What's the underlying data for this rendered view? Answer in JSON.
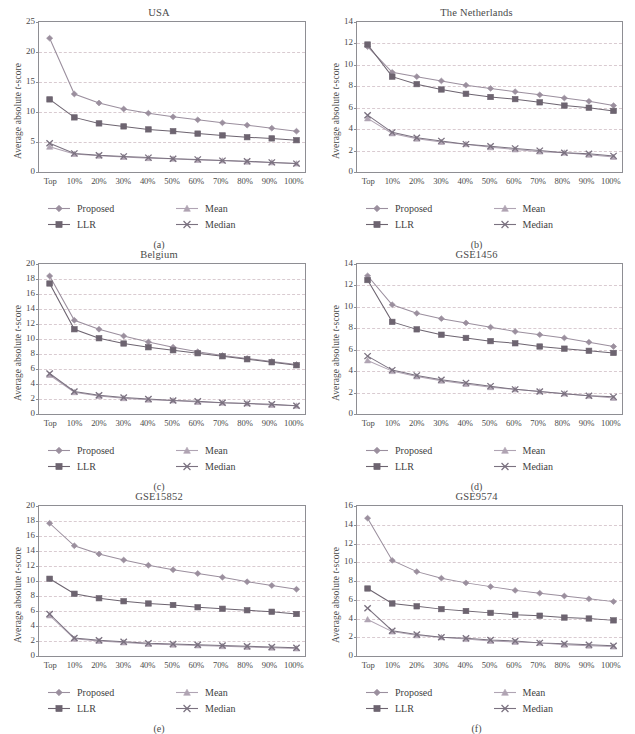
{
  "figure": {
    "ylabel": "Average absolute t-score",
    "xcategories": [
      "Top",
      "10%",
      "20%",
      "30%",
      "40%",
      "50%",
      "60%",
      "70%",
      "80%",
      "90%",
      "100%"
    ],
    "legend": [
      {
        "name": "Proposed",
        "marker": "diamond",
        "color": "#9b8f9e"
      },
      {
        "name": "LLR",
        "marker": "square",
        "color": "#6d6470"
      },
      {
        "name": "Mean",
        "marker": "triangle",
        "color": "#b0a4b3"
      },
      {
        "name": "Median",
        "marker": "cross",
        "color": "#7b7280"
      }
    ],
    "colors": {
      "axis": "#8e8e93",
      "grid": "#d8c9cf",
      "text": "#4a4a4a",
      "proposed": "#9b8f9e",
      "llr": "#6d6470",
      "mean": "#b0a4b3",
      "median": "#7b7280"
    }
  },
  "chart_data": [
    {
      "type": "line",
      "panel": "a",
      "caption": "(a)",
      "title": "USA",
      "xlabel": "",
      "ylabel": "Average absolute t-score",
      "x": [
        "Top",
        "10%",
        "20%",
        "30%",
        "40%",
        "50%",
        "60%",
        "70%",
        "80%",
        "90%",
        "100%"
      ],
      "ylim": [
        0,
        25
      ],
      "yticks": [
        0,
        5,
        10,
        15,
        20,
        25
      ],
      "grid": true,
      "legend_position": "below",
      "series": [
        {
          "name": "Proposed",
          "values": [
            22.3,
            13.0,
            11.5,
            10.5,
            9.8,
            9.2,
            8.7,
            8.2,
            7.8,
            7.3,
            6.8
          ]
        },
        {
          "name": "LLR",
          "values": [
            12.1,
            9.1,
            8.1,
            7.6,
            7.1,
            6.8,
            6.4,
            6.1,
            5.8,
            5.6,
            5.3
          ]
        },
        {
          "name": "Mean",
          "values": [
            4.2,
            3.0,
            2.7,
            2.5,
            2.3,
            2.2,
            2.0,
            1.9,
            1.7,
            1.6,
            1.4
          ]
        },
        {
          "name": "Median",
          "values": [
            4.8,
            3.1,
            2.8,
            2.6,
            2.4,
            2.2,
            2.1,
            1.9,
            1.8,
            1.6,
            1.4
          ]
        }
      ]
    },
    {
      "type": "line",
      "panel": "b",
      "caption": "(b)",
      "title": "The Netherlands",
      "xlabel": "",
      "ylabel": "Average absolute t-score",
      "x": [
        "Top",
        "10%",
        "20%",
        "30%",
        "40%",
        "50%",
        "60%",
        "70%",
        "80%",
        "90%",
        "100%"
      ],
      "ylim": [
        0,
        14
      ],
      "yticks": [
        0,
        2,
        4,
        6,
        8,
        10,
        12,
        14
      ],
      "grid": true,
      "legend_position": "below",
      "series": [
        {
          "name": "Proposed",
          "values": [
            11.7,
            9.3,
            8.9,
            8.5,
            8.1,
            7.8,
            7.5,
            7.2,
            6.9,
            6.6,
            6.2
          ]
        },
        {
          "name": "LLR",
          "values": [
            11.9,
            8.9,
            8.2,
            7.7,
            7.3,
            7.0,
            6.8,
            6.5,
            6.2,
            6.0,
            5.7
          ]
        },
        {
          "name": "Mean",
          "values": [
            5.0,
            3.6,
            3.1,
            2.8,
            2.6,
            2.3,
            2.1,
            1.9,
            1.8,
            1.6,
            1.4
          ]
        },
        {
          "name": "Median",
          "values": [
            5.3,
            3.7,
            3.2,
            2.9,
            2.6,
            2.4,
            2.2,
            2.0,
            1.8,
            1.7,
            1.5
          ]
        }
      ]
    },
    {
      "type": "line",
      "panel": "c",
      "caption": "(c)",
      "title": "Belgium",
      "xlabel": "",
      "ylabel": "Average absolute t-score",
      "x": [
        "Top",
        "10%",
        "20%",
        "30%",
        "40%",
        "50%",
        "60%",
        "70%",
        "80%",
        "90%",
        "100%"
      ],
      "ylim": [
        0,
        20
      ],
      "yticks": [
        0,
        2,
        4,
        6,
        8,
        10,
        12,
        14,
        16,
        18,
        20
      ],
      "grid": true,
      "legend_position": "below",
      "series": [
        {
          "name": "Proposed",
          "values": [
            18.4,
            12.5,
            11.3,
            10.4,
            9.6,
            8.9,
            8.3,
            7.8,
            7.4,
            7.0,
            6.6
          ]
        },
        {
          "name": "LLR",
          "values": [
            17.4,
            11.3,
            10.1,
            9.4,
            8.9,
            8.5,
            8.1,
            7.7,
            7.3,
            6.9,
            6.5
          ]
        },
        {
          "name": "Mean",
          "values": [
            5.2,
            2.9,
            2.4,
            2.1,
            1.9,
            1.8,
            1.6,
            1.5,
            1.4,
            1.2,
            1.1
          ]
        },
        {
          "name": "Median",
          "values": [
            5.4,
            3.0,
            2.5,
            2.2,
            2.0,
            1.8,
            1.7,
            1.5,
            1.4,
            1.3,
            1.1
          ]
        }
      ]
    },
    {
      "type": "line",
      "panel": "d",
      "caption": "(d)",
      "title": "GSE1456",
      "xlabel": "",
      "ylabel": "Average absolute t-score",
      "x": [
        "Top",
        "10%",
        "20%",
        "30%",
        "40%",
        "50%",
        "60%",
        "70%",
        "80%",
        "90%",
        "100%"
      ],
      "ylim": [
        0,
        14
      ],
      "yticks": [
        0,
        2,
        4,
        6,
        8,
        10,
        12,
        14
      ],
      "grid": true,
      "legend_position": "below",
      "series": [
        {
          "name": "Proposed",
          "values": [
            12.9,
            10.2,
            9.4,
            8.9,
            8.5,
            8.1,
            7.7,
            7.4,
            7.1,
            6.7,
            6.3
          ]
        },
        {
          "name": "LLR",
          "values": [
            12.5,
            8.6,
            7.9,
            7.4,
            7.1,
            6.8,
            6.6,
            6.3,
            6.1,
            5.9,
            5.7
          ]
        },
        {
          "name": "Mean",
          "values": [
            5.0,
            4.0,
            3.5,
            3.1,
            2.8,
            2.5,
            2.3,
            2.1,
            1.9,
            1.7,
            1.5
          ]
        },
        {
          "name": "Median",
          "values": [
            5.4,
            4.1,
            3.6,
            3.2,
            2.9,
            2.6,
            2.3,
            2.1,
            1.9,
            1.7,
            1.6
          ]
        }
      ]
    },
    {
      "type": "line",
      "panel": "e",
      "caption": "(e)",
      "title": "GSE15852",
      "xlabel": "",
      "ylabel": "Average absolute t-score",
      "x": [
        "Top",
        "10%",
        "20%",
        "30%",
        "40%",
        "50%",
        "60%",
        "70%",
        "80%",
        "90%",
        "100%"
      ],
      "ylim": [
        0,
        20
      ],
      "yticks": [
        0,
        2,
        4,
        6,
        8,
        10,
        12,
        14,
        16,
        18,
        20
      ],
      "grid": true,
      "legend_position": "below",
      "series": [
        {
          "name": "Proposed",
          "values": [
            17.7,
            14.7,
            13.6,
            12.8,
            12.1,
            11.5,
            11.0,
            10.5,
            9.9,
            9.4,
            8.9
          ]
        },
        {
          "name": "LLR",
          "values": [
            10.3,
            8.3,
            7.7,
            7.3,
            7.0,
            6.8,
            6.5,
            6.3,
            6.1,
            5.9,
            5.6
          ]
        },
        {
          "name": "Mean",
          "values": [
            5.4,
            2.3,
            2.0,
            1.8,
            1.6,
            1.5,
            1.4,
            1.3,
            1.2,
            1.1,
            1.0
          ]
        },
        {
          "name": "Median",
          "values": [
            5.6,
            2.4,
            2.1,
            1.9,
            1.7,
            1.6,
            1.5,
            1.4,
            1.3,
            1.2,
            1.1
          ]
        }
      ]
    },
    {
      "type": "line",
      "panel": "f",
      "caption": "(f)",
      "title": "GSE9574",
      "xlabel": "",
      "ylabel": "Average absolute t-score",
      "x": [
        "Top",
        "10%",
        "20%",
        "30%",
        "40%",
        "50%",
        "60%",
        "70%",
        "80%",
        "90%",
        "100%"
      ],
      "ylim": [
        0,
        16
      ],
      "yticks": [
        0,
        2,
        4,
        6,
        8,
        10,
        12,
        14,
        16
      ],
      "grid": true,
      "legend_position": "below",
      "series": [
        {
          "name": "Proposed",
          "values": [
            14.7,
            10.2,
            9.0,
            8.3,
            7.8,
            7.4,
            7.0,
            6.7,
            6.4,
            6.1,
            5.8
          ]
        },
        {
          "name": "LLR",
          "values": [
            7.2,
            5.6,
            5.3,
            5.0,
            4.8,
            4.6,
            4.4,
            4.3,
            4.1,
            4.0,
            3.8
          ]
        },
        {
          "name": "Mean",
          "values": [
            3.9,
            2.6,
            2.2,
            2.0,
            1.8,
            1.6,
            1.5,
            1.4,
            1.2,
            1.1,
            1.0
          ]
        },
        {
          "name": "Median",
          "values": [
            5.1,
            2.7,
            2.3,
            2.0,
            1.9,
            1.7,
            1.6,
            1.4,
            1.3,
            1.2,
            1.1
          ]
        }
      ]
    }
  ]
}
